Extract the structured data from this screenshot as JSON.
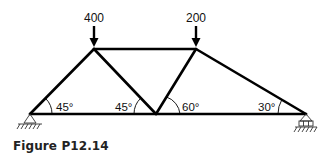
{
  "figure": {
    "caption": "Figure P12.14",
    "type": "plane truss"
  },
  "loads": [
    {
      "label": "400",
      "joint": "top-left",
      "direction": "down"
    },
    {
      "label": "200",
      "joint": "top-right",
      "direction": "down"
    }
  ],
  "angles": [
    {
      "label": "45°",
      "location": "left support"
    },
    {
      "label": "45°",
      "location": "bottom-middle joint, left side"
    },
    {
      "label": "60°",
      "location": "bottom-middle joint, right side"
    },
    {
      "label": "30°",
      "location": "right support"
    }
  ],
  "supports": [
    {
      "type": "pin",
      "location": "left"
    },
    {
      "type": "roller",
      "location": "right"
    }
  ],
  "colors": {
    "member": "#000000",
    "text": "#111111",
    "support": "#333333"
  }
}
